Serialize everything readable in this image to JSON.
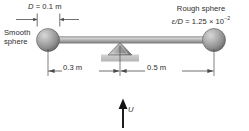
{
  "figure": {
    "type": "engineering-free-body-diagram"
  },
  "labels": {
    "diameter": "D = 0.1 m",
    "diameter_symbol": "D",
    "diameter_value": "= 0.1 m",
    "smooth_sphere_line1": "Smooth",
    "smooth_sphere_line2": "sphere",
    "rough_sphere_line1": "Rough sphere",
    "rough_roughness_symbol": "ε/D",
    "rough_roughness_value": "= 1.25 × 10",
    "rough_roughness_exponent": "−2",
    "left_arm_length": "0.3 m",
    "right_arm_length": "0.5 m",
    "flow_velocity": "U"
  },
  "geometry": {
    "left_sphere_center_x": 48,
    "right_sphere_center_x": 214,
    "fulcrum_x": 120,
    "rod_y": 40,
    "dimension_line_y": 71,
    "sphere_radius": 11.5
  },
  "colors": {
    "background": "#ffffff",
    "sphere_light": "#c9c9c9",
    "sphere_mid": "#9a9a9a",
    "sphere_dark": "#6b6b6b",
    "rod_light": "#d0d0d0",
    "rod_mid": "#a7a7a7",
    "rod_dark": "#7d7d7d",
    "line": "#4a4a4a",
    "base_plate": "#c4c4c4",
    "text": "#2b2b2b"
  },
  "icons": {
    "flow_arrow": "up-arrow-icon",
    "fulcrum": "triangle-fulcrum-icon"
  }
}
